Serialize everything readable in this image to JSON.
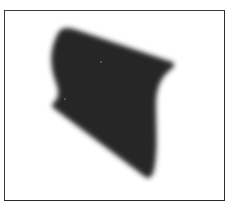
{
  "image": {
    "description": "Blurred dark irregular quadrilateral shape on white background inside a thin dark rectangular frame",
    "colors": {
      "background": "#ffffff",
      "frame": "#333333",
      "shape": "#262626",
      "speck": "#5a5a5a"
    },
    "frame": {
      "x": 4,
      "y": 10,
      "width": 221,
      "height": 191
    },
    "shape": {
      "outline": [
        [
          60,
          30
        ],
        [
          175,
          64
        ],
        [
          158,
          100
        ],
        [
          150,
          178
        ],
        [
          147,
          178
        ],
        [
          52,
          107
        ],
        [
          55,
          85
        ],
        [
          52,
          45
        ]
      ],
      "specks": [
        {
          "x": 101,
          "y": 62
        },
        {
          "x": 65,
          "y": 99
        }
      ]
    }
  }
}
